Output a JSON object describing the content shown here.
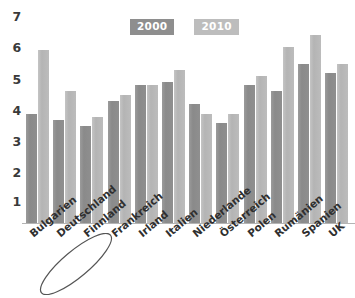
{
  "chart_data": {
    "type": "bar",
    "title": "",
    "subtitle": "",
    "xlabel": "",
    "ylabel": "",
    "ylim": [
      0,
      7
    ],
    "ytick_labels": [
      "7",
      "6",
      "5",
      "4",
      "3",
      "2",
      "1"
    ],
    "ytick_values": [
      7,
      6,
      5,
      4,
      3,
      2,
      1
    ],
    "grid": false,
    "legend_position": "top-center",
    "categories": [
      "Bulgarien",
      "Deutschland",
      "Finnland",
      "Frankreich",
      "Irland",
      "Italien",
      "Niederlande",
      "Österreich",
      "Polen",
      "Rumänien",
      "Spanien",
      "UK"
    ],
    "series": [
      {
        "name": "2000",
        "color": "#8e8e8e",
        "values": [
          3.7,
          3.5,
          3.3,
          4.15,
          4.7,
          4.8,
          4.05,
          3.4,
          4.7,
          4.5,
          5.4,
          5.1
        ]
      },
      {
        "name": "2010",
        "color": "#bdbdbd",
        "values": [
          5.9,
          4.5,
          3.6,
          4.35,
          4.7,
          5.2,
          3.7,
          3.7,
          5.0,
          6.0,
          6.4,
          5.4
        ]
      }
    ],
    "annotations": [
      {
        "type": "hand-drawn-oval",
        "target": "Deutschland",
        "color": "#555555"
      }
    ]
  },
  "legend": {
    "items": [
      {
        "label": "2000"
      },
      {
        "label": "2010"
      }
    ]
  },
  "colors": {
    "series_2000": "#8e8e8e",
    "series_2010": "#bdbdbd",
    "axis": "#b4b4b4",
    "text": "#2f2f2f",
    "annotation": "#555555"
  }
}
